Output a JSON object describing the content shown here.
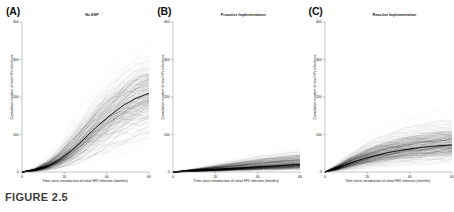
{
  "figure": {
    "caption": "FIGURE 2.5",
    "background_color": "#ffffff",
    "axis_color": "#8a8a8a",
    "trace_color": "#000000",
    "median_color": "#000000"
  },
  "axes": {
    "xlabel": "Time since introduction of initial HIV infection (months)",
    "ylabel": "Cumulative number of new HIV infections",
    "xticks": [
      0,
      20,
      40,
      60
    ],
    "yticks": [
      0,
      100,
      200,
      300,
      400
    ],
    "xlim": [
      0,
      60
    ],
    "ylim": [
      0,
      400
    ],
    "grid": false
  },
  "panels": [
    {
      "letter": "(A)",
      "title": "No ESP"
    },
    {
      "letter": "(B)",
      "title": "Proactive Implementation"
    },
    {
      "letter": "(C)",
      "title": "Reactive Implementation"
    }
  ],
  "chart_data": [
    {
      "type": "line",
      "title": "No ESP",
      "panel": "(A)",
      "xlabel": "Time since introduction of initial HIV infection (months)",
      "ylabel": "Cumulative number of new HIV infections",
      "xlim": [
        0,
        60
      ],
      "ylim": [
        0,
        400
      ],
      "grid": false,
      "legend": "none",
      "description": "Dense spaghetti plot of many stochastic simulation trajectories with a bold median overlay; trajectories fan out widely, sigmoid/saturating shape.",
      "x": [
        0,
        6,
        12,
        18,
        24,
        30,
        36,
        42,
        48,
        54,
        60
      ],
      "series": [
        {
          "name": "median",
          "values": [
            0,
            5,
            16,
            34,
            60,
            92,
            124,
            153,
            178,
            197,
            210
          ]
        },
        {
          "name": "upper_envelope",
          "values": [
            0,
            14,
            45,
            92,
            146,
            200,
            246,
            282,
            308,
            325,
            335
          ]
        },
        {
          "name": "upper_quartile",
          "values": [
            0,
            8,
            27,
            57,
            96,
            138,
            178,
            212,
            239,
            259,
            272
          ]
        },
        {
          "name": "lower_quartile",
          "values": [
            0,
            3,
            9,
            19,
            34,
            53,
            75,
            96,
            115,
            130,
            141
          ]
        },
        {
          "name": "lower_envelope",
          "values": [
            0,
            0,
            1,
            3,
            6,
            10,
            15,
            21,
            27,
            33,
            38
          ]
        }
      ]
    },
    {
      "type": "line",
      "title": "Proactive Implementation",
      "panel": "(B)",
      "xlabel": "Time since introduction of initial HIV infection (months)",
      "ylabel": "Cumulative number of new HIV infections",
      "xlim": [
        0,
        60
      ],
      "ylim": [
        0,
        400
      ],
      "grid": false,
      "legend": "none",
      "description": "Dense spaghetti plot of stochastic trajectories, strongly suppressed relative to panel A; near-linear slow growth with narrow envelope.",
      "x": [
        0,
        6,
        12,
        18,
        24,
        30,
        36,
        42,
        48,
        54,
        60
      ],
      "series": [
        {
          "name": "median",
          "values": [
            0,
            2,
            4,
            6,
            8,
            10,
            12,
            14,
            16,
            18,
            20
          ]
        },
        {
          "name": "upper_envelope",
          "values": [
            0,
            6,
            13,
            21,
            29,
            37,
            45,
            52,
            58,
            63,
            67
          ]
        },
        {
          "name": "upper_quartile",
          "values": [
            0,
            4,
            8,
            13,
            18,
            23,
            28,
            32,
            36,
            39,
            42
          ]
        },
        {
          "name": "lower_quartile",
          "values": [
            0,
            1,
            2,
            3,
            4,
            6,
            7,
            8,
            9,
            10,
            11
          ]
        },
        {
          "name": "lower_envelope",
          "values": [
            0,
            0,
            0,
            1,
            1,
            2,
            2,
            3,
            3,
            4,
            4
          ]
        }
      ]
    },
    {
      "type": "line",
      "title": "Reactive Implementation",
      "panel": "(C)",
      "xlabel": "Time since introduction of initial HIV infection (months)",
      "ylabel": "Cumulative number of new HIV infections",
      "xlim": [
        0,
        60
      ],
      "ylim": [
        0,
        400
      ],
      "grid": false,
      "legend": "none",
      "description": "Dense spaghetti plot of stochastic trajectories; intermediate between panels A and B, rapid early rise then flattening.",
      "x": [
        0,
        6,
        12,
        18,
        24,
        30,
        36,
        42,
        48,
        54,
        60
      ],
      "series": [
        {
          "name": "median",
          "values": [
            0,
            11,
            24,
            35,
            44,
            52,
            58,
            63,
            67,
            70,
            72
          ]
        },
        {
          "name": "upper_envelope",
          "values": [
            0,
            26,
            56,
            82,
            102,
            118,
            131,
            141,
            149,
            155,
            159
          ]
        },
        {
          "name": "upper_quartile",
          "values": [
            0,
            17,
            38,
            55,
            69,
            80,
            89,
            96,
            102,
            106,
            109
          ]
        },
        {
          "name": "lower_quartile",
          "values": [
            0,
            6,
            14,
            21,
            27,
            32,
            36,
            39,
            42,
            44,
            46
          ]
        },
        {
          "name": "lower_envelope",
          "values": [
            0,
            2,
            4,
            7,
            9,
            11,
            13,
            15,
            16,
            17,
            18
          ]
        }
      ]
    }
  ]
}
